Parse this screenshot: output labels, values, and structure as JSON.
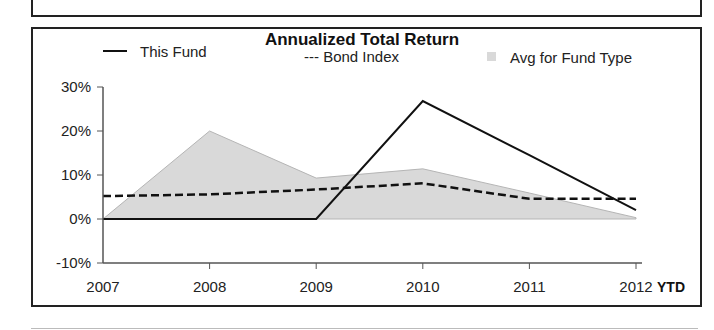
{
  "chart_data": {
    "type": "line",
    "title": "Annualized Total Return",
    "xlabel": "",
    "ylabel": "",
    "x": [
      "2007",
      "2008",
      "2009",
      "2010",
      "2011",
      "2012"
    ],
    "x_suffix": "YTD",
    "ylim": [
      -10,
      30
    ],
    "yticks": [
      -10,
      0,
      10,
      20,
      30
    ],
    "ytick_labels": [
      "-10%",
      "0%",
      "10%",
      "20%",
      "30%"
    ],
    "grid": false,
    "legend": "top",
    "series": [
      {
        "name": "This Fund",
        "style": "solid-line",
        "legend_label": "This Fund",
        "values": [
          0,
          0,
          0,
          26.8,
          14.5,
          2.0
        ]
      },
      {
        "name": "Bond Index",
        "style": "dashed-line",
        "legend_label": "--- Bond Index",
        "values": [
          5.2,
          5.6,
          6.7,
          8.1,
          4.6,
          4.6
        ]
      },
      {
        "name": "Avg for Fund Type",
        "style": "area",
        "legend_label": "Avg for Fund Type",
        "values": [
          0,
          20.0,
          9.3,
          11.4,
          5.9,
          0.3
        ]
      }
    ],
    "colors": {
      "line": "#111111",
      "area_fill": "#d9d9d9",
      "area_edge": "#b5b5b5",
      "axis": "#555555"
    }
  }
}
